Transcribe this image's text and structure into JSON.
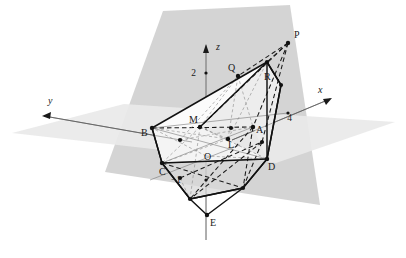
{
  "figure": {
    "background": "#ffffff",
    "colors": {
      "plane_tilted": "#d2d2d2",
      "plane_horizontal": "#e9e9e9",
      "solid_fill": "#f2f2f2",
      "stroke": "#1a1a1a",
      "thin_stroke": "#555555",
      "point": "#111111"
    }
  },
  "axes": [
    {
      "name": "x",
      "label": "x",
      "label_x": 318,
      "label_y": 93,
      "from_x": 232,
      "from_y": 140,
      "to_x": 330,
      "to_y": 99
    },
    {
      "name": "y",
      "label": "y",
      "label_x": 48,
      "label_y": 104,
      "from_x": 192,
      "from_y": 142,
      "to_x": 44,
      "to_y": 116
    },
    {
      "name": "z",
      "label": "z",
      "label_x": 216,
      "label_y": 50,
      "from_x": 206,
      "from_y": 240,
      "to_x": 206,
      "to_y": 45
    }
  ],
  "ticks": [
    {
      "name": "tick-z-2",
      "label": "2",
      "label_x": 196,
      "label_y": 76,
      "mark_x": 206,
      "mark_y": 73
    },
    {
      "name": "tick-z-minus1",
      "label": "−1",
      "label_x": 181,
      "label_y": 183,
      "mark_x": 206,
      "mark_y": 180
    },
    {
      "name": "tick-x-4",
      "label": "4",
      "label_x": 292,
      "label_y": 121,
      "mark_x": 288,
      "mark_y": 113
    }
  ],
  "points": [
    {
      "name": "P",
      "label": "P",
      "x": 288,
      "y": 43,
      "label_x": 294,
      "label_y": 38,
      "dot": true
    },
    {
      "name": "Q",
      "label": "Q",
      "x": 238,
      "y": 76,
      "label_x": 228,
      "label_y": 71,
      "dot": true
    },
    {
      "name": "R",
      "label": "R",
      "x": 263,
      "y": 67,
      "label_x": 264,
      "label_y": 80,
      "dot": false
    },
    {
      "name": "M",
      "label": "M",
      "x": 200,
      "y": 127,
      "label_x": 189,
      "label_y": 123,
      "dot": true
    },
    {
      "name": "A",
      "label": "A",
      "x": 253,
      "y": 127,
      "label_x": 256,
      "label_y": 133,
      "dot": true
    },
    {
      "name": "B",
      "label": "B",
      "x": 152,
      "y": 128,
      "label_x": 141,
      "label_y": 136,
      "dot": true
    },
    {
      "name": "L",
      "label": "L",
      "x": 228,
      "y": 139,
      "label_x": 228,
      "label_y": 148,
      "dot": true
    },
    {
      "name": "O",
      "label": "O",
      "x": 206,
      "y": 156,
      "label_x": 204,
      "label_y": 160,
      "dot": false
    },
    {
      "name": "C",
      "label": "C",
      "x": 162,
      "y": 163,
      "label_x": 159,
      "label_y": 175,
      "dot": true
    },
    {
      "name": "D",
      "label": "D",
      "x": 267,
      "y": 159,
      "label_x": 268,
      "label_y": 170,
      "dot": true
    },
    {
      "name": "E",
      "label": "E",
      "x": 207,
      "y": 215,
      "label_x": 210,
      "label_y": 226,
      "dot": true
    }
  ],
  "extra_dots": [
    {
      "name": "dot-upper-apex",
      "x": 267,
      "y": 62
    },
    {
      "name": "dot-right-upper",
      "x": 281,
      "y": 85
    },
    {
      "name": "dot-right-lower",
      "x": 262,
      "y": 142
    },
    {
      "name": "dot-lower-left",
      "x": 180,
      "y": 178
    },
    {
      "name": "dot-lower-mid",
      "x": 190,
      "y": 199
    },
    {
      "name": "dot-lower-right",
      "x": 243,
      "y": 188
    },
    {
      "name": "dot-mid-b",
      "x": 180,
      "y": 140
    },
    {
      "name": "dot-on-axis",
      "x": 231,
      "y": 128
    }
  ],
  "planes": {
    "tilted": {
      "name": "tilted-plane",
      "points": "163,11 290,5 320,205 105,172"
    },
    "horizontal": {
      "name": "horizontal-plane",
      "points": "12,133 124,104 395,122 276,163"
    }
  },
  "solid": {
    "name": "polyhedron",
    "outline": "267,62 281,85 267,159 243,188 190,199 162,163 152,128",
    "top_face": "267,62 200,127 152,128",
    "right_face": "267,62 281,85 267,159 253,127 200,127",
    "front_face": "152,128 200,127 267,159 162,163",
    "bottom_face": "162,163 267,159 243,188 190,199"
  }
}
